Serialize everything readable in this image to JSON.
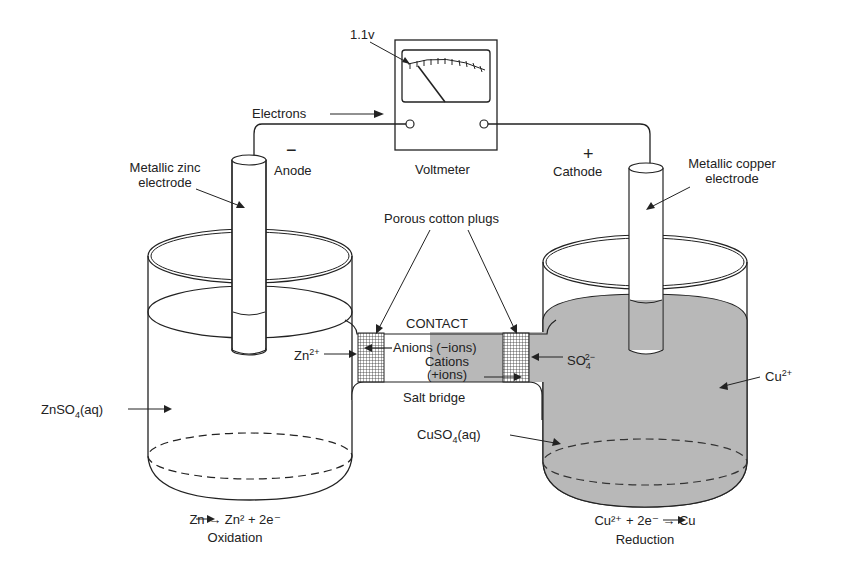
{
  "diagram": {
    "voltmeter": {
      "label": "Voltmeter",
      "reading": "1.1v"
    },
    "wire": {
      "electrons_label": "Electrons"
    },
    "anode": {
      "sign": "−",
      "label": "Anode",
      "electrode_label_line1": "Metallic zinc",
      "electrode_label_line2": "electrode",
      "solution_label": "ZnSO",
      "solution_sub": "4",
      "solution_suffix": "(aq)",
      "ion_label": "Zn",
      "ion_sup": "2+",
      "reaction": "Zn → Zn² + 2e⁻",
      "process": "Oxidation"
    },
    "cathode": {
      "sign": "+",
      "label": "Cathode",
      "electrode_label_line1": "Metallic copper",
      "electrode_label_line2": "electrode",
      "solution_label": "CuSO",
      "solution_sub": "4",
      "solution_suffix": "(aq)",
      "ion_label": "Cu",
      "ion_sup": "2+",
      "reaction": "Cu²⁺ + 2e⁻ → Cu",
      "process": "Reduction"
    },
    "salt_bridge": {
      "label": "Salt bridge",
      "contact_label": "CONTACT",
      "plugs_label": "Porous cotton plugs",
      "anions_label": "Anions (−ions)",
      "cations_label_line1": "Cations",
      "cations_label_line2": "(+ions)",
      "sulfate_label": "SO",
      "sulfate_sub": "4",
      "sulfate_sup": "2−"
    },
    "colors": {
      "ink": "#222222",
      "solution_fill": "#b8b8b8",
      "background": "#ffffff"
    }
  }
}
